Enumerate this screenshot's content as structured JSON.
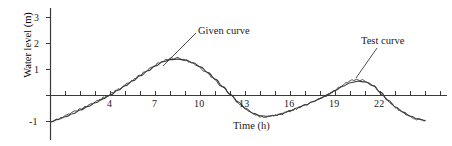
{
  "figure": {
    "name": "water-level-vs-time-chart",
    "background_color": "#ffffff",
    "line_color": "#3a3a3a",
    "text_color": "#1a1a1a"
  },
  "axes": {
    "x_title": "Time (h)",
    "y_title": "Water level (m)",
    "x_tick_labels": [
      "4",
      "7",
      "10",
      "13",
      "16",
      "19",
      "22"
    ],
    "x_tick_values": [
      4,
      7,
      10,
      13,
      16,
      19,
      22
    ],
    "y_tick_labels": [
      "3",
      "2",
      "1",
      "-1"
    ],
    "y_tick_values": [
      3,
      2,
      1,
      -1
    ]
  },
  "annotations": {
    "given_curve_label": "Given curve",
    "test_curve_label": "Test curve"
  },
  "chart_data": {
    "type": "line",
    "title": "",
    "subtitle": "",
    "xlabel": "Time (h)",
    "ylabel": "Water level (m)",
    "xlim": [
      0,
      25.5
    ],
    "ylim": [
      -1.6,
      3.4
    ],
    "xticks": [
      0,
      1,
      2,
      3,
      4,
      5,
      6,
      7,
      8,
      9,
      10,
      11,
      12,
      13,
      14,
      15,
      16,
      17,
      18,
      19,
      20,
      21,
      22,
      23,
      24,
      25
    ],
    "xtick_labels_shown": [
      4,
      7,
      10,
      13,
      16,
      19,
      22
    ],
    "yticks": [
      -1,
      0,
      1,
      2,
      3
    ],
    "ytick_labels_shown": [
      3,
      2,
      1,
      -1
    ],
    "grid": false,
    "legend": "annotated-callouts",
    "legend_position": "in-plot",
    "x": [
      0,
      0.5,
      1,
      1.5,
      2,
      2.5,
      3,
      3.5,
      4,
      4.5,
      5,
      5.5,
      6,
      6.5,
      7,
      7.5,
      8,
      8.5,
      9,
      9.5,
      10,
      10.5,
      11,
      11.5,
      12,
      12.5,
      13,
      13.5,
      14,
      14.5,
      15,
      15.5,
      16,
      16.5,
      17,
      17.5,
      18,
      18.5,
      19,
      19.5,
      20,
      20.5,
      21,
      21.5,
      22,
      22.5,
      23,
      23.5,
      24,
      24.5,
      25
    ],
    "series": [
      {
        "name": "Given curve",
        "style": "smooth",
        "values": [
          -1.02,
          -0.92,
          -0.82,
          -0.7,
          -0.56,
          -0.42,
          -0.28,
          -0.13,
          0.02,
          0.2,
          0.38,
          0.57,
          0.76,
          0.95,
          1.14,
          1.3,
          1.38,
          1.4,
          1.36,
          1.26,
          1.1,
          0.88,
          0.62,
          0.33,
          0.04,
          -0.24,
          -0.49,
          -0.68,
          -0.78,
          -0.8,
          -0.76,
          -0.68,
          -0.58,
          -0.47,
          -0.36,
          -0.24,
          -0.11,
          0.04,
          0.2,
          0.36,
          0.49,
          0.55,
          0.52,
          0.38,
          0.12,
          -0.18,
          -0.44,
          -0.64,
          -0.8,
          -0.9,
          -0.96
        ]
      },
      {
        "name": "Test curve",
        "style": "jagged-noisy",
        "values": [
          -0.98,
          -0.9,
          -0.79,
          -0.66,
          -0.53,
          -0.4,
          -0.25,
          -0.1,
          0.05,
          0.23,
          0.41,
          0.6,
          0.79,
          0.98,
          1.17,
          1.34,
          1.42,
          1.43,
          1.37,
          1.24,
          1.06,
          0.84,
          0.58,
          0.3,
          0.01,
          -0.27,
          -0.52,
          -0.71,
          -0.81,
          -0.82,
          -0.77,
          -0.69,
          -0.59,
          -0.48,
          -0.37,
          -0.25,
          -0.12,
          0.03,
          0.21,
          0.4,
          0.56,
          0.62,
          0.56,
          0.4,
          0.1,
          -0.2,
          -0.46,
          -0.66,
          -0.82,
          -0.92,
          -0.98
        ]
      }
    ]
  }
}
